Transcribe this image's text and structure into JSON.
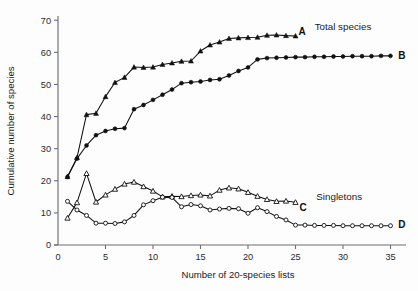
{
  "chart_data": {
    "type": "line",
    "title": "",
    "xlabel": "Number of 20-species lists",
    "ylabel": "Cumulative number of species",
    "xlim": [
      0,
      36
    ],
    "ylim": [
      0,
      71
    ],
    "xticks": [
      0,
      5,
      10,
      15,
      20,
      25,
      30,
      35
    ],
    "yticks": [
      0,
      10,
      20,
      30,
      40,
      50,
      60,
      70
    ],
    "xtick_labels": [
      "0",
      "5",
      "10",
      "15",
      "20",
      "25",
      "30",
      "35"
    ],
    "ytick_labels": [
      "0",
      "10",
      "20",
      "30",
      "40",
      "50",
      "60",
      "70"
    ],
    "grid": false,
    "legend_position": "inline-right",
    "group_labels": [
      {
        "id": "total-species",
        "text": "Total species",
        "x": 30.0,
        "y": 68.0
      },
      {
        "id": "singletons",
        "text": "Singletons",
        "x": 29.6,
        "y": 15.0
      }
    ],
    "series": [
      {
        "name": "A",
        "label": "A",
        "group": "Total species",
        "marker": "filled-triangle",
        "color": "#111111",
        "label_x": 25.7,
        "label_y": 66.5,
        "x": [
          1,
          2,
          3,
          4,
          5,
          6,
          7,
          8,
          9,
          10,
          11,
          12,
          13,
          14,
          15,
          16,
          17,
          18,
          19,
          20,
          21,
          22,
          23,
          24,
          25
        ],
        "values": [
          21.3,
          27.2,
          40.6,
          41.0,
          46.2,
          50.6,
          52.2,
          55.4,
          55.3,
          55.4,
          56.2,
          56.7,
          57.2,
          57.3,
          60.4,
          62.3,
          63.2,
          64.3,
          64.5,
          64.6,
          64.7,
          65.3,
          65.4,
          65.2,
          65.1
        ]
      },
      {
        "name": "B",
        "label": "B",
        "group": "Total species",
        "marker": "filled-circle",
        "color": "#111111",
        "label_x": 36.2,
        "label_y": 58.9,
        "x": [
          1,
          2,
          3,
          4,
          5,
          6,
          7,
          8,
          9,
          10,
          11,
          12,
          13,
          14,
          15,
          16,
          17,
          18,
          19,
          20,
          21,
          22,
          23,
          24,
          25,
          26,
          27,
          28,
          29,
          30,
          31,
          32,
          33,
          34,
          35
        ],
        "values": [
          21.2,
          26.9,
          31.0,
          34.2,
          35.5,
          36.2,
          36.4,
          42.3,
          43.6,
          45.2,
          46.8,
          48.4,
          50.4,
          50.7,
          50.9,
          51.4,
          51.6,
          52.8,
          54.2,
          55.3,
          57.8,
          58.2,
          58.3,
          58.4,
          58.5,
          58.5,
          58.6,
          58.6,
          58.7,
          58.7,
          58.8,
          58.8,
          58.8,
          58.9,
          58.9
        ]
      },
      {
        "name": "C",
        "label": "C",
        "group": "Singletons",
        "marker": "open-triangle",
        "color": "#111111",
        "label_x": 25.8,
        "label_y": 11.6,
        "x": [
          1,
          2,
          3,
          4,
          5,
          6,
          7,
          8,
          9,
          10,
          11,
          12,
          13,
          14,
          15,
          16,
          17,
          18,
          19,
          20,
          21,
          22,
          23,
          24,
          25
        ],
        "values": [
          8.4,
          13.2,
          22.3,
          13.4,
          15.6,
          17.4,
          19.0,
          19.6,
          18.2,
          16.8,
          15.0,
          15.2,
          15.1,
          15.4,
          15.6,
          15.3,
          17.1,
          17.8,
          17.5,
          16.4,
          15.2,
          14.2,
          13.6,
          13.7,
          13.3
        ]
      },
      {
        "name": "D",
        "label": "D",
        "group": "Singletons",
        "marker": "open-circle",
        "color": "#111111",
        "label_x": 36.2,
        "label_y": 6.2,
        "x": [
          1,
          2,
          3,
          4,
          5,
          6,
          7,
          8,
          9,
          10,
          11,
          12,
          13,
          14,
          15,
          16,
          17,
          18,
          19,
          20,
          21,
          22,
          23,
          24,
          25,
          26,
          27,
          28,
          29,
          30,
          31,
          32,
          33,
          34,
          35
        ],
        "values": [
          13.6,
          10.9,
          9.2,
          6.8,
          6.8,
          6.7,
          7.2,
          9.2,
          12.5,
          13.8,
          14.9,
          14.8,
          11.9,
          12.6,
          12.2,
          10.9,
          11.2,
          11.4,
          11.3,
          9.9,
          11.6,
          10.4,
          8.9,
          7.8,
          6.2,
          6.2,
          6.1,
          6.1,
          6.1,
          6.0,
          6.0,
          6.0,
          6.0,
          6.0,
          6.0
        ]
      }
    ]
  }
}
